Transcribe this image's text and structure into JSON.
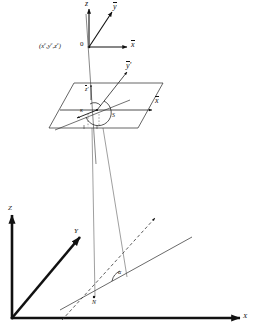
{
  "figure": {
    "caption": "Perspective center, rotated image plane and world coordinate system"
  },
  "camera_frame": {
    "origin_label": "0",
    "center_coordinates": {
      "open": "(",
      "x": "x",
      "x_sup": "c",
      "sep1": ",",
      "y": "y",
      "y_sup": "c",
      "sep2": ",",
      "z": "z",
      "z_sup": "c",
      "close": ")"
    },
    "axes": [
      {
        "name": "z-bar",
        "label": "z"
      },
      {
        "name": "y-bar",
        "label": "y"
      },
      {
        "name": "x-bar",
        "label": "x"
      }
    ]
  },
  "image_plane": {
    "axes": [
      {
        "name": "y-prime-bar",
        "label": "y",
        "prime": "'"
      },
      {
        "name": "x-plane-bar",
        "label": "x"
      },
      {
        "name": "z-prime-bar",
        "label": "z",
        "prime": "'"
      }
    ],
    "angles": [
      {
        "name": "kappa",
        "label": "κ"
      },
      {
        "name": "swing",
        "label": "S"
      }
    ]
  },
  "world_frame": {
    "axes": [
      {
        "name": "Z-axis",
        "label": "Z"
      },
      {
        "name": "Y-axis",
        "label": "Y"
      },
      {
        "name": "X-axis",
        "label": "X"
      }
    ],
    "node_line_label": "N",
    "angles": [
      {
        "name": "alpha",
        "label": "α"
      }
    ]
  },
  "colors": {
    "ink": "#111111",
    "thin_line": "#4a4a4a",
    "medium_line": "#222222",
    "background": "#ffffff"
  }
}
